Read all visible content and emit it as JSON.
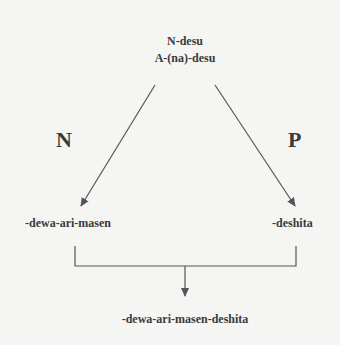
{
  "diagram": {
    "top_node": {
      "line1": "N-desu",
      "line2": "A-(na)-desu"
    },
    "left_edge_label": "N",
    "right_edge_label": "P",
    "left_node": "-dewa-ari-masen",
    "right_node": "-deshita",
    "bottom_node": "-dewa-ari-masen-deshita",
    "colors": {
      "background": "#f5f5f3",
      "text": "#3a3a3a",
      "line": "#555555"
    }
  }
}
